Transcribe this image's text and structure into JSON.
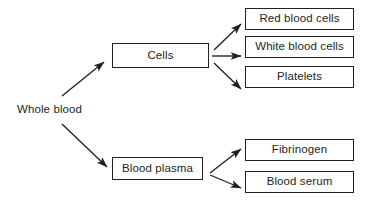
{
  "diagram": {
    "type": "flow-tree",
    "stroke_color": "#231f20",
    "background_color": "#ffffff",
    "root": {
      "label": "Whole blood"
    },
    "branches": [
      {
        "label": "Cells",
        "children": [
          {
            "label": "Red blood cells"
          },
          {
            "label": "White blood cells"
          },
          {
            "label": "Platelets"
          }
        ]
      },
      {
        "label": "Blood plasma",
        "children": [
          {
            "label": "Fibrinogen"
          },
          {
            "label": "Blood serum"
          }
        ]
      }
    ],
    "arrows": [
      {
        "name": "whole-blood-to-cells",
        "from": "Whole blood",
        "to": "Cells"
      },
      {
        "name": "whole-blood-to-blood-plasma",
        "from": "Whole blood",
        "to": "Blood plasma"
      },
      {
        "name": "cells-to-red-blood-cells",
        "from": "Cells",
        "to": "Red blood cells"
      },
      {
        "name": "cells-to-white-blood-cells",
        "from": "Cells",
        "to": "White blood cells"
      },
      {
        "name": "cells-to-platelets",
        "from": "Cells",
        "to": "Platelets"
      },
      {
        "name": "blood-plasma-to-fibrinogen",
        "from": "Blood plasma",
        "to": "Fibrinogen"
      },
      {
        "name": "blood-plasma-to-blood-serum",
        "from": "Blood plasma",
        "to": "Blood serum"
      }
    ]
  }
}
